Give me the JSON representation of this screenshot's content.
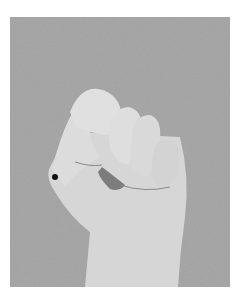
{
  "image": {
    "subject": "fist-hand-photo",
    "background_color": "#a9a9a9",
    "skin_color": "#d8d8d8",
    "marker_color": "#111111"
  }
}
